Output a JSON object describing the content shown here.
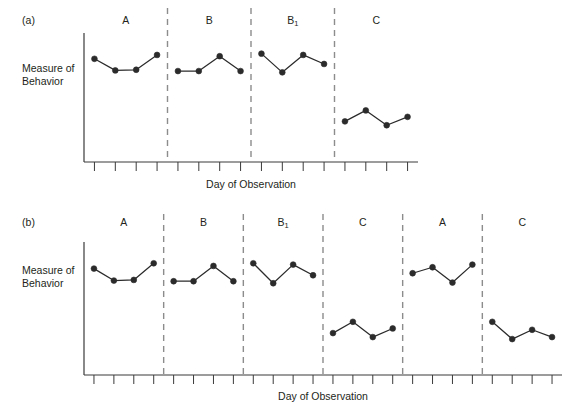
{
  "figure": {
    "background": "#ffffff",
    "ink": "#231f20",
    "axis_color": "#3a3a3a",
    "marker_color": "#2b2b2b",
    "dash_color": "#8c8c8c"
  },
  "chart_data": [
    {
      "type": "line",
      "panel_letter": "(a)",
      "title": "",
      "xlabel": "Day of Observation",
      "ylabel": "Measure of\nBehavior",
      "grid": false,
      "legend": "none",
      "axis": {
        "x_range": [
          0,
          16
        ],
        "y_range": [
          0,
          100
        ],
        "y_ticks": [],
        "x_tick_count": 16
      },
      "phase_labels": [
        "A",
        "B",
        "B1",
        "C"
      ],
      "phase_labels_display": [
        "A",
        "B",
        "B₁",
        "C"
      ],
      "phase_boundaries": [
        4,
        8,
        12
      ],
      "x": [
        1,
        2,
        3,
        4,
        5,
        6,
        7,
        8,
        9,
        10,
        11,
        12,
        13,
        14,
        15,
        16
      ],
      "series": [
        {
          "name": "A",
          "phase": "A",
          "x": [
            1,
            2,
            3,
            4
          ],
          "values": [
            80,
            71,
            71.5,
            83
          ]
        },
        {
          "name": "B",
          "phase": "B",
          "x": [
            5,
            6,
            7,
            8
          ],
          "values": [
            70.5,
            70.5,
            82,
            70.5
          ]
        },
        {
          "name": "B1",
          "phase": "B₁",
          "x": [
            9,
            10,
            11,
            12
          ],
          "values": [
            84,
            69.5,
            83,
            76
          ]
        },
        {
          "name": "C",
          "phase": "C",
          "x": [
            13,
            14,
            15,
            16
          ],
          "values": [
            31.5,
            40,
            28.5,
            35
          ]
        }
      ]
    },
    {
      "type": "line",
      "panel_letter": "(b)",
      "title": "",
      "xlabel": "Day of Observation",
      "ylabel": "Measure of\nBehavior",
      "grid": false,
      "legend": "none",
      "axis": {
        "x_range": [
          0,
          24
        ],
        "y_range": [
          0,
          100
        ],
        "y_ticks": [],
        "x_tick_count": 24
      },
      "phase_labels": [
        "A",
        "B",
        "B1",
        "C",
        "A",
        "C"
      ],
      "phase_labels_display": [
        "A",
        "B",
        "B₁",
        "C",
        "A",
        "C"
      ],
      "phase_boundaries": [
        4,
        8,
        12,
        16,
        20
      ],
      "x": [
        1,
        2,
        3,
        4,
        5,
        6,
        7,
        8,
        9,
        10,
        11,
        12,
        13,
        14,
        15,
        16,
        17,
        18,
        19,
        20,
        21,
        22,
        23,
        24
      ],
      "series": [
        {
          "name": "A-1",
          "phase": "A",
          "x": [
            1,
            2,
            3,
            4
          ],
          "values": [
            80,
            71,
            71.5,
            84
          ]
        },
        {
          "name": "B",
          "phase": "B",
          "x": [
            5,
            6,
            7,
            8
          ],
          "values": [
            70.5,
            70.5,
            82,
            70.5
          ]
        },
        {
          "name": "B1",
          "phase": "B₁",
          "x": [
            9,
            10,
            11,
            12
          ],
          "values": [
            84,
            69,
            83,
            75
          ]
        },
        {
          "name": "C-1",
          "phase": "C",
          "x": [
            13,
            14,
            15,
            16
          ],
          "values": [
            31.5,
            40,
            28.5,
            35
          ]
        },
        {
          "name": "A-2",
          "phase": "A",
          "x": [
            17,
            18,
            19,
            20
          ],
          "values": [
            76.5,
            81,
            69.5,
            83
          ]
        },
        {
          "name": "C-2",
          "phase": "C",
          "x": [
            21,
            22,
            23,
            24
          ],
          "values": [
            40,
            27,
            34,
            28.5
          ]
        }
      ]
    }
  ],
  "caption": ""
}
